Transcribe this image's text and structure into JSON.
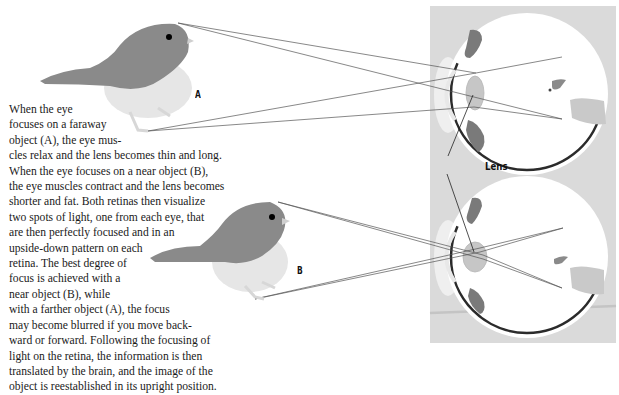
{
  "figure": {
    "labels": {
      "far_object": "A",
      "near_object": "B",
      "lens": "Lens"
    },
    "description_lines": [
      "When the eye",
      "focuses on a faraway",
      "object (A), the eye mus-",
      "cles relax and the lens becomes thin and long.",
      "When the eye focuses on a near object (B),",
      "the eye muscles contract and the lens becomes",
      "shorter and fat. Both retinas then visualize",
      "two spots of light, one from each eye, that",
      "are then perfectly focused and in an",
      "upside-down pattern on each",
      "retina. The best degree of",
      "focus is achieved with a",
      "near object (B), while",
      "with a farther object (A), the focus",
      "may become blurred if you move back-",
      "ward or forward. Following the focusing of",
      "light on the retina, the information is then",
      "translated by the brain, and the image of the",
      "object is reestablished in its upright position."
    ],
    "colors": {
      "panel_gray": "#d9d9d9",
      "bird_gray": "#8a8a8a",
      "bird_belly": "#e6e6e6",
      "eye_muscle": "#7a7a7a",
      "retina_dark": "#2b2b2b",
      "ray_line": "#555555"
    }
  }
}
